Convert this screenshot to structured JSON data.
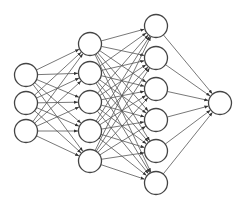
{
  "diagram": {
    "type": "feedforward-neural-network",
    "colors": {
      "background": "#ffffff",
      "node_fill": "#ffffff",
      "node_stroke": "#444444",
      "edge": "#555555"
    },
    "node_radius": 11.5,
    "fully_connected": true,
    "directed": true,
    "layers": [
      {
        "name": "input-layer",
        "x": 26,
        "nodes": [
          75,
          103,
          131
        ]
      },
      {
        "name": "hidden-layer-1",
        "x": 90,
        "nodes": [
          44,
          73,
          102,
          131,
          161
        ]
      },
      {
        "name": "hidden-layer-2",
        "x": 156,
        "nodes": [
          26,
          58,
          89,
          120,
          151,
          183
        ]
      },
      {
        "name": "output-layer",
        "x": 220,
        "nodes": [
          103
        ]
      }
    ]
  }
}
